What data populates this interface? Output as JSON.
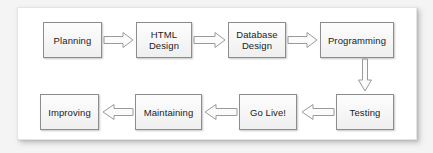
{
  "diagram": {
    "panel_background": "#ffffff",
    "mat_background": "#f4f4f4",
    "node_border_color": "#8d8d8d",
    "arrow_stroke_color": "#9a9a9a",
    "arrow_fill_color": "#fbfbfb",
    "nodes": [
      {
        "id": "planning",
        "label": "Planning",
        "row": 1,
        "x": 43,
        "y": 22,
        "w": 59,
        "h": 36
      },
      {
        "id": "html-design",
        "label": "HTML\nDesign",
        "row": 1,
        "x": 136,
        "y": 22,
        "w": 56,
        "h": 36
      },
      {
        "id": "database-design",
        "label": "Database\nDesign",
        "row": 1,
        "x": 228,
        "y": 22,
        "w": 58,
        "h": 36
      },
      {
        "id": "programming",
        "label": "Programming",
        "row": 1,
        "x": 320,
        "y": 22,
        "w": 74,
        "h": 36
      },
      {
        "id": "improving",
        "label": "Improving",
        "row": 2,
        "x": 40,
        "y": 94,
        "w": 59,
        "h": 36
      },
      {
        "id": "maintaining",
        "label": "Maintaining",
        "row": 2,
        "x": 135,
        "y": 94,
        "w": 67,
        "h": 36
      },
      {
        "id": "go-live",
        "label": "Go Live!",
        "row": 2,
        "x": 239,
        "y": 94,
        "w": 58,
        "h": 36
      },
      {
        "id": "testing",
        "label": "Testing",
        "row": 2,
        "x": 336,
        "y": 94,
        "w": 58,
        "h": 36
      }
    ],
    "arrows": [
      {
        "id": "planning-to-html-design",
        "from": "planning",
        "to": "html-design",
        "direction": "right"
      },
      {
        "id": "html-design-to-database-design",
        "from": "html-design",
        "to": "database-design",
        "direction": "right"
      },
      {
        "id": "database-design-to-programming",
        "from": "database-design",
        "to": "programming",
        "direction": "right"
      },
      {
        "id": "programming-to-testing",
        "from": "programming",
        "to": "testing",
        "direction": "down"
      },
      {
        "id": "testing-to-go-live",
        "from": "testing",
        "to": "go-live",
        "direction": "left"
      },
      {
        "id": "go-live-to-maintaining",
        "from": "go-live",
        "to": "maintaining",
        "direction": "left"
      },
      {
        "id": "maintaining-to-improving",
        "from": "maintaining",
        "to": "improving",
        "direction": "left"
      }
    ]
  }
}
